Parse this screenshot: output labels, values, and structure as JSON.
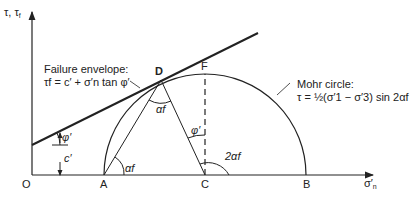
{
  "axes": {
    "y_label": "τ, τ",
    "y_label_sub": "f",
    "x_label": "σ′",
    "x_label_sub": "n",
    "origin": "O"
  },
  "points": {
    "A": "A",
    "B": "B",
    "C": "C",
    "D": "D",
    "F": "F"
  },
  "failure_envelope": {
    "title": "Failure envelope:",
    "equation": "τf = c′ + σ′n tan φ′"
  },
  "mohr_circle": {
    "title": "Mohr circle:",
    "equation": "τ = ½(σ′1 − σ′3) sin 2αf"
  },
  "angles": {
    "phi_envelope": "φ′",
    "cohesion": "c′",
    "alpha_at_A": "αf",
    "alpha_at_D": "αf",
    "phi_at_C": "φ′",
    "two_alpha": "2αf"
  }
}
